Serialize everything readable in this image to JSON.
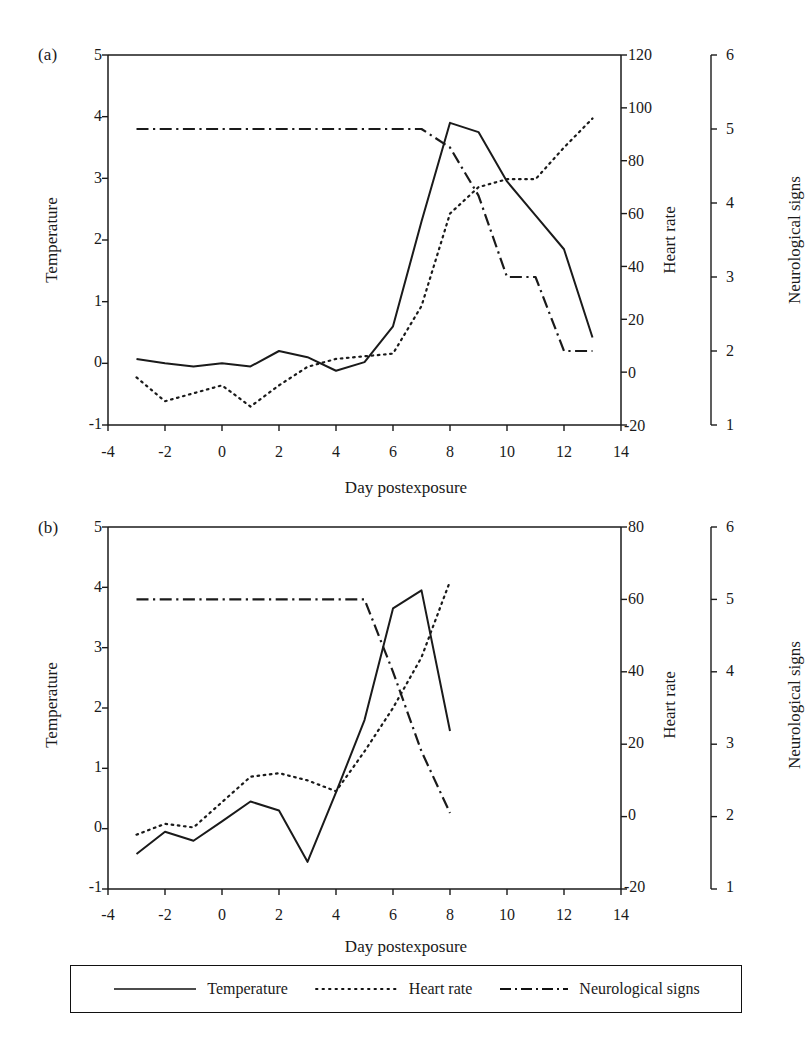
{
  "figure": {
    "background": "#ffffff",
    "ink": "#1a1a1a",
    "xlabel": "Day postexposure",
    "panels": [
      {
        "id": "a",
        "label": "(a)",
        "ylabel_left": "Temperature",
        "ylabel_right1": "Heart rate",
        "ylabel_right2": "Neurological signs"
      },
      {
        "id": "b",
        "label": "(b)",
        "ylabel_left": "Temperature",
        "ylabel_right1": "Heart rate",
        "ylabel_right2": "Neurological signs"
      }
    ]
  },
  "legend": {
    "position": "bottom-center",
    "entries": [
      {
        "label": "Temperature",
        "style": "solid",
        "color": "#111111"
      },
      {
        "label": "Heart rate",
        "style": "dotted",
        "color": "#111111"
      },
      {
        "label": "Neurological signs",
        "style": "dashdot",
        "color": "#111111"
      }
    ]
  },
  "chart_data": [
    {
      "type": "line",
      "panel": "a",
      "title": "(a)",
      "xlabel": "Day postexposure",
      "ylabel": "Temperature",
      "xlim": [
        -4,
        14
      ],
      "xticks": [
        -4,
        -2,
        0,
        2,
        4,
        6,
        8,
        10,
        12,
        14
      ],
      "ylim": [
        -1,
        5
      ],
      "yticks": [
        -1,
        0,
        1,
        2,
        3,
        4,
        5
      ],
      "y2label": "Heart rate",
      "y2lim": [
        -20,
        120
      ],
      "y2ticks": [
        -20,
        0,
        20,
        40,
        60,
        80,
        100,
        120
      ],
      "y3label": "Neurological signs",
      "y3lim": [
        1,
        6
      ],
      "y3ticks": [
        1,
        2,
        3,
        4,
        5,
        6
      ],
      "grid": false,
      "legend": "bottom",
      "series": [
        {
          "name": "Temperature",
          "axis": "left",
          "style": "solid",
          "x": [
            -3,
            -2,
            -1,
            0,
            1,
            2,
            3,
            4,
            5,
            6,
            7,
            8,
            9,
            10,
            11,
            12,
            13
          ],
          "values": [
            0.07,
            0.0,
            -0.05,
            0.0,
            -0.05,
            0.2,
            0.1,
            -0.12,
            0.02,
            0.6,
            2.3,
            3.9,
            3.75,
            2.95,
            2.4,
            1.85,
            0.42
          ]
        },
        {
          "name": "Heart rate",
          "axis": "right",
          "style": "dotted",
          "x": [
            -3,
            -2,
            -1,
            0,
            1,
            2,
            3,
            4,
            5,
            6,
            7,
            8,
            9,
            10,
            11,
            12,
            13
          ],
          "values": [
            -2,
            -11,
            -8,
            -5,
            -13,
            -5,
            2,
            5,
            6,
            7,
            25,
            60,
            70,
            73,
            73,
            85,
            96
          ]
        },
        {
          "name": "Neurological signs",
          "axis": "neuro",
          "style": "dashdot",
          "x": [
            -3,
            -2,
            -1,
            0,
            1,
            2,
            3,
            4,
            5,
            6,
            7,
            8,
            9,
            10,
            11,
            12,
            13
          ],
          "values": [
            5,
            5,
            5,
            5,
            5,
            5,
            5,
            5,
            5,
            5,
            5,
            4.75,
            4.1,
            3.0,
            3.0,
            2.0,
            2.0
          ]
        }
      ]
    },
    {
      "type": "line",
      "panel": "b",
      "title": "(b)",
      "xlabel": "Day postexposure",
      "ylabel": "Temperature",
      "xlim": [
        -4,
        14
      ],
      "xticks": [
        -4,
        -2,
        0,
        2,
        4,
        6,
        8,
        10,
        12,
        14
      ],
      "ylim": [
        -1,
        5
      ],
      "yticks": [
        -1,
        0,
        1,
        2,
        3,
        4,
        5
      ],
      "y2label": "Heart rate",
      "y2lim": [
        -20,
        80
      ],
      "y2ticks": [
        -20,
        0,
        20,
        40,
        60,
        80
      ],
      "y3label": "Neurological signs",
      "y3lim": [
        1,
        6
      ],
      "y3ticks": [
        1,
        2,
        3,
        4,
        5,
        6
      ],
      "grid": false,
      "legend": "bottom",
      "series": [
        {
          "name": "Temperature",
          "axis": "left",
          "style": "solid",
          "x": [
            -3,
            -2,
            -1,
            0,
            1,
            2,
            3,
            4,
            5,
            6,
            7,
            8
          ],
          "values": [
            -0.42,
            -0.05,
            -0.2,
            0.12,
            0.45,
            0.3,
            -0.55,
            0.6,
            1.8,
            3.65,
            3.95,
            1.62
          ]
        },
        {
          "name": "Heart rate",
          "axis": "right",
          "style": "dotted",
          "x": [
            -3,
            -2,
            -1,
            0,
            1,
            2,
            3,
            4,
            5,
            6,
            7,
            8
          ],
          "values": [
            -5,
            -2,
            -3,
            4,
            11,
            12,
            10,
            7,
            18,
            30,
            44,
            65
          ]
        },
        {
          "name": "Neurological signs",
          "axis": "neuro",
          "style": "dashdot",
          "x": [
            -3,
            -2,
            -1,
            0,
            1,
            2,
            3,
            4,
            5,
            6,
            7,
            8
          ],
          "values": [
            5,
            5,
            5,
            5,
            5,
            5,
            5,
            5,
            5,
            4.0,
            2.9,
            2.05
          ]
        }
      ]
    }
  ]
}
